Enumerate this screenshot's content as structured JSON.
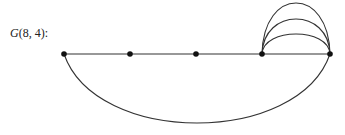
{
  "label": {
    "name": "G",
    "args": "(8, 4):"
  },
  "graph": {
    "stroke_color": "#333333",
    "node_color": "#111111",
    "nodes": [
      {
        "id": 1,
        "x": 64,
        "y": 54
      },
      {
        "id": 2,
        "x": 130,
        "y": 54
      },
      {
        "id": 3,
        "x": 196,
        "y": 54
      },
      {
        "id": 4,
        "x": 262,
        "y": 54
      },
      {
        "id": 5,
        "x": 330,
        "y": 54
      }
    ],
    "edges": [
      {
        "type": "line",
        "from": 1,
        "to": 2
      },
      {
        "type": "line",
        "from": 2,
        "to": 3
      },
      {
        "type": "line",
        "from": 3,
        "to": 4
      },
      {
        "type": "line",
        "from": 4,
        "to": 5
      },
      {
        "type": "arc-up",
        "from": 4,
        "to": 5,
        "peak_y": 34
      },
      {
        "type": "arc-up",
        "from": 4,
        "to": 5,
        "peak_y": 19
      },
      {
        "type": "arc-up",
        "from": 4,
        "to": 5,
        "peak_y": 3
      },
      {
        "type": "arc-down",
        "from": 1,
        "to": 5,
        "bottom_y": 123
      }
    ]
  }
}
